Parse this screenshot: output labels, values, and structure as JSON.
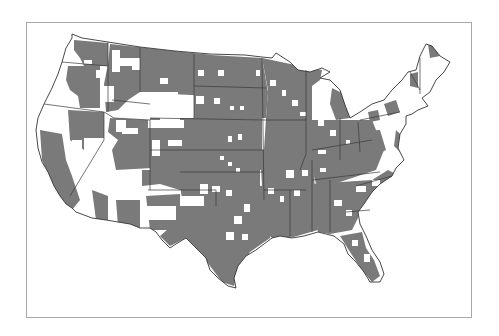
{
  "map": {
    "subject": "Contiguous United States county map",
    "legend": null,
    "colors": {
      "shaded": "#7a7a7a",
      "unshaded": "#ffffff",
      "border": "#3a3a3a",
      "frame": "#a8a8a8"
    },
    "frame": {
      "x": 26,
      "y": 22,
      "width": 446,
      "height": 296
    },
    "states_outline": true,
    "notes": "Gray = counties in category; white = counties not in category"
  }
}
